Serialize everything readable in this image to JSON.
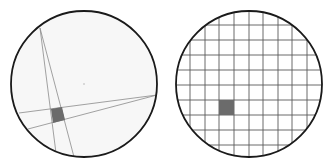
{
  "diagram": {
    "colors": {
      "background": "#ffffff",
      "circle_fill": "#f7f7f7",
      "circle_stroke": "#1a1a1a",
      "line_stroke": "#8a8a8a",
      "grid_stroke": "#5a5a5a",
      "shaded_fill": "#6b6b6b"
    },
    "left_panel": {
      "circle": {
        "cx": 84,
        "cy": 84,
        "r": 73
      },
      "center_mark": {
        "cx": 84,
        "cy": 84,
        "r": 1
      },
      "chords": [
        {
          "x1": 40,
          "y1": 28,
          "x2": 74,
          "y2": 157
        },
        {
          "x1": 40,
          "y1": 28,
          "x2": 56,
          "y2": 153
        },
        {
          "x1": 157,
          "y1": 95,
          "x2": 19,
          "y2": 113
        },
        {
          "x1": 157,
          "y1": 95,
          "x2": 28,
          "y2": 129
        }
      ],
      "shaded_region": {
        "points": "51,109 62,107 65,120 53,123"
      }
    },
    "right_panel": {
      "circle": {
        "cx": 249,
        "cy": 84,
        "r": 73
      },
      "grid": {
        "vertical_x": [
          190,
          205,
          219,
          234,
          249,
          263,
          278,
          292,
          307
        ],
        "horizontal_y": [
          25,
          40,
          55,
          70,
          85,
          100,
          115,
          130,
          145
        ]
      },
      "shaded_cell": {
        "x": 219,
        "y": 100,
        "width": 15,
        "height": 15
      }
    }
  }
}
